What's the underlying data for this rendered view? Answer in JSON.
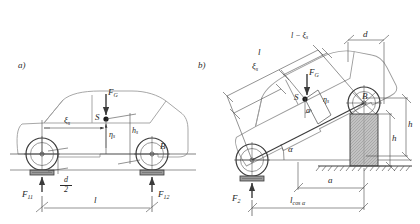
{
  "figure": {
    "background": "#ffffff",
    "line_color": "#3a3a3a",
    "dim_color": "#4a4a4a",
    "hatch_color": "#6b6b6b",
    "block_fill": "#b9b9b9",
    "tire_fill": "#9a9a9a"
  },
  "panel_a": {
    "id": "a)",
    "labels": {
      "force_g": "F",
      "force_g_sub": "G",
      "cg_point": "S",
      "point_b": "B",
      "xi_s": "ξ",
      "xi_s_sub": "s",
      "eta_s": "η",
      "eta_s_sub": "s",
      "h_s": "h",
      "h_s_sub": "s",
      "f11": "F",
      "f11_sub": "11",
      "f12": "F",
      "f12_sub": "12",
      "wheelbase": "l",
      "half_diameter_num": "d",
      "half_diameter_den": "2"
    }
  },
  "panel_b": {
    "id": "b)",
    "labels": {
      "force_g": "F",
      "force_g_sub": "G",
      "cg_point": "S",
      "point_b": "B",
      "length_l": "l",
      "l_minus_xi": "l − ξ",
      "l_minus_xi_sub": "s",
      "xi_s": "ξ",
      "xi_s_sub": "s",
      "eta_s": "η",
      "eta_s_sub": "s",
      "alpha_incline": "α",
      "alpha_cg": "α",
      "diameter_d": "d",
      "height_h_outer": "h",
      "height_h_inner": "h",
      "distance_a": "a",
      "f2": "F",
      "f2_sub": "2",
      "l_cos_alpha": "l",
      "l_cos_alpha_sub": "cos α"
    }
  }
}
